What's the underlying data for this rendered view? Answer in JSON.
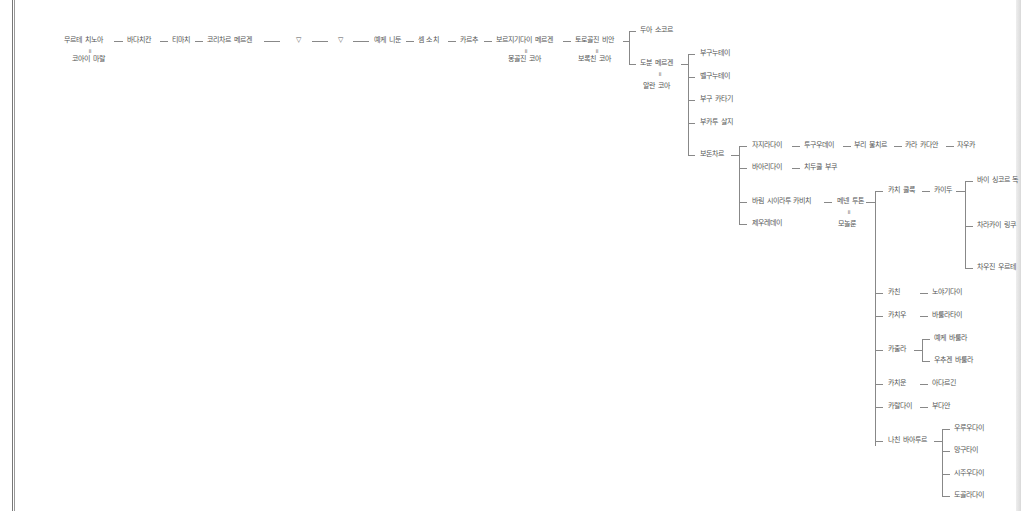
{
  "tree": {
    "ancestry_chain": [
      {
        "name": "무르테 치노아",
        "spouse": "코아이 마랄"
      },
      {
        "name": "바다치칸"
      },
      {
        "name": "티마치"
      },
      {
        "name": "코리차르 메르겐"
      },
      {
        "name": "▽"
      },
      {
        "name": "▽"
      },
      {
        "name": "예케 니둔"
      },
      {
        "name": "셈 소치"
      },
      {
        "name": "카르추"
      },
      {
        "name": "보르지기다이 메르겐",
        "spouse": "몽골진 코아"
      },
      {
        "name": "토로골진 비안",
        "spouse": "보록친 코아"
      }
    ],
    "torogoljin_children": [
      {
        "name": "두아 소코르"
      },
      {
        "name": "도분 메르겐",
        "spouse": "알란 코아"
      }
    ],
    "dobun_children": [
      {
        "name": "부구누테이"
      },
      {
        "name": "벨구누테이"
      },
      {
        "name": "부구 카타기"
      },
      {
        "name": "부카투 살지"
      },
      {
        "name": "보돈차르"
      }
    ],
    "bodonchar_line_1": [
      "자지라다이",
      "투구우데이",
      "부리 불치르",
      "카라 카다안",
      "자우카"
    ],
    "bodonchar_line_2": [
      "바아리다이",
      "치두쿨 부쿠"
    ],
    "bodonchar_line_3": {
      "name": "바림 시이라투 카비치",
      "child": "메넨 투톤",
      "child_spouse": "모놀룬"
    },
    "bodonchar_line_4": "제우레데이",
    "menen_children": [
      {
        "name": "카치 쿨룩",
        "child": "카이두",
        "grandchildren": [
          "바이 싱코르 독",
          "차라카이 링쿠",
          "차우진 우르테"
        ]
      },
      {
        "name": "카친",
        "child": "노야기다이"
      },
      {
        "name": "카치우",
        "child": "바룰라타이"
      },
      {
        "name": "카출라",
        "children": [
          "예케 바룰라",
          "우추겐 바룰라"
        ]
      },
      {
        "name": "카치운",
        "child": "아다르긴"
      },
      {
        "name": "카랄다이",
        "child": "부다안"
      },
      {
        "name": "나친 바아투르",
        "children": [
          "우루우다이",
          "망구타이",
          "시주우다이",
          "도골라다이"
        ]
      }
    ],
    "marriage_symbol": "॥"
  }
}
